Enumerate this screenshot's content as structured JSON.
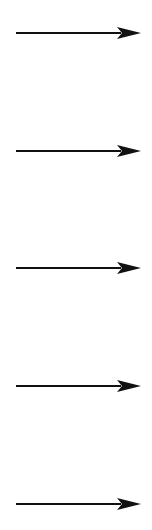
{
  "diagram": {
    "type": "arrow-column",
    "color": "#111111",
    "arrows": [
      {
        "direction": "right",
        "y": 33,
        "x_start": 16,
        "x_end": 141
      },
      {
        "direction": "right",
        "y": 151,
        "x_start": 16,
        "x_end": 141
      },
      {
        "direction": "right",
        "y": 268,
        "x_start": 16,
        "x_end": 141
      },
      {
        "direction": "right",
        "y": 386,
        "x_start": 16,
        "x_end": 141
      },
      {
        "direction": "right",
        "y": 504,
        "x_start": 16,
        "x_end": 141
      }
    ]
  }
}
